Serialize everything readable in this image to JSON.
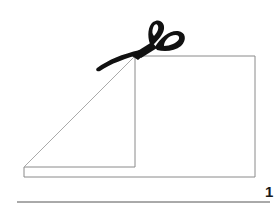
{
  "diagram": {
    "step_number": "1",
    "colors": {
      "line": "#8a8a8a",
      "scissors": "#111111",
      "underline": "#555555",
      "background": "#ffffff"
    },
    "icons": [
      "scissors-icon"
    ]
  }
}
